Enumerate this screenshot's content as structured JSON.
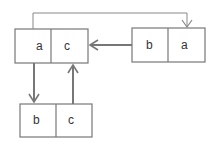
{
  "diagram": {
    "type": "linked-list-nodes",
    "nodes": [
      {
        "id": "node-top-left",
        "cells": [
          "a",
          "c"
        ]
      },
      {
        "id": "node-right",
        "cells": [
          "b",
          "a"
        ]
      },
      {
        "id": "node-bottom",
        "cells": [
          "b",
          "c"
        ]
      }
    ],
    "edges": [
      {
        "from": "node-top-left.a",
        "to": "node-right.a",
        "style": "thin elbow arrow"
      },
      {
        "from": "node-right",
        "to": "node-top-left",
        "style": "arrow"
      },
      {
        "from": "node-top-left.a",
        "to": "node-bottom.b",
        "style": "arrow"
      },
      {
        "from": "node-bottom.c",
        "to": "node-top-left.c",
        "style": "arrow"
      }
    ],
    "colors": {
      "stroke": "#777777",
      "text": "#333333",
      "background": "#ffffff"
    }
  }
}
